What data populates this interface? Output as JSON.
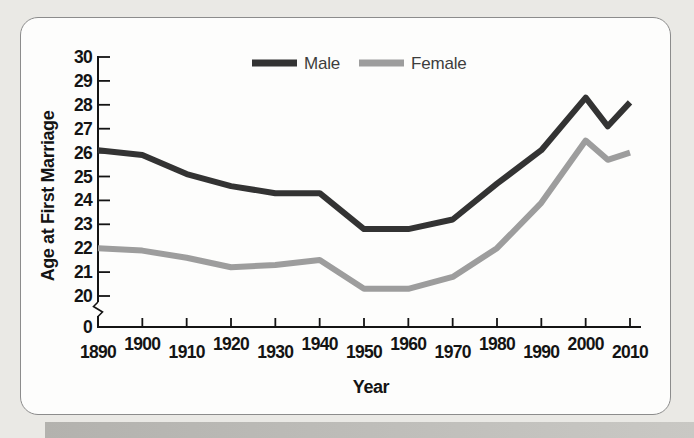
{
  "figure": {
    "background_color": "#eae9e5",
    "card_color": "#fdfdfc",
    "card_border_color": "#8c8c8c",
    "shadow_color": "#b9b8b4",
    "axis_color": "#141414",
    "text_color": "#141414"
  },
  "chart_data": {
    "type": "line",
    "title": "",
    "xlabel": "Year",
    "ylabel": "Age at First Marriage",
    "x": [
      1890,
      1900,
      1910,
      1920,
      1930,
      1940,
      1950,
      1960,
      1970,
      1980,
      1990,
      2000,
      2005,
      2010
    ],
    "series": [
      {
        "name": "Male",
        "color": "#333333",
        "values": [
          26.1,
          25.9,
          25.1,
          24.6,
          24.3,
          24.3,
          22.8,
          22.8,
          23.2,
          24.7,
          26.1,
          28.3,
          27.1,
          28.1
        ]
      },
      {
        "name": "Female",
        "color": "#9d9d9d",
        "values": [
          22.0,
          21.9,
          21.6,
          21.2,
          21.3,
          21.5,
          20.3,
          20.3,
          20.8,
          22.0,
          23.9,
          26.5,
          25.7,
          26.0
        ]
      }
    ],
    "x_tick_labels": [
      "1890",
      "1900",
      "1910",
      "1920",
      "1930",
      "1940",
      "1950",
      "1960",
      "1970",
      "1980",
      "1990",
      "2000",
      "2010"
    ],
    "y_tick_labels": [
      "30",
      "29",
      "28",
      "27",
      "26",
      "25",
      "24",
      "23",
      "22",
      "21",
      "20"
    ],
    "y_axis_break_label": "0",
    "axis_break": true,
    "xlim": [
      1890,
      2010
    ],
    "ylim": [
      20,
      30
    ],
    "grid": false,
    "legend_position": "top-center"
  }
}
